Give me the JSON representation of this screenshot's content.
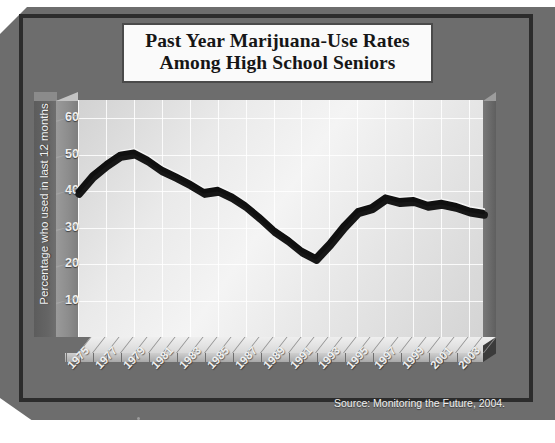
{
  "figure": {
    "title_line1": "Past Year Marijuana-Use Rates",
    "title_line2": "Among High School Seniors",
    "source": "Source: Monitoring the Future, 2004.",
    "colors": {
      "background": "#6d6d6d",
      "plot_face": "#eeeeee",
      "line": "#151515",
      "line_highlight": "#ffffff",
      "frame": "#2c2c2c",
      "axis_slab": "#8d8d8d",
      "label_slab": "#636363",
      "tick_text": "#f0f0f0"
    }
  },
  "chart_data": {
    "type": "line",
    "title": "Past Year Marijuana-Use Rates Among High School Seniors",
    "xlabel": "",
    "ylabel": "Percentage who used in last 12 months",
    "ylim": [
      0,
      65
    ],
    "xlim": [
      1975,
      2004
    ],
    "grid": true,
    "legend": null,
    "ytick_labels": [
      "60",
      "50",
      "40",
      "30",
      "20",
      "10"
    ],
    "ytick_values": [
      60,
      50,
      40,
      30,
      20,
      10
    ],
    "xtick_labels": [
      "1975",
      "1977",
      "1979",
      "1981",
      "1983",
      "1985",
      "1987",
      "1989",
      "1991",
      "1993",
      "1995",
      "1997",
      "1999",
      "2001",
      "2003"
    ],
    "xtick_values": [
      1975,
      1977,
      1979,
      1981,
      1983,
      1985,
      1987,
      1989,
      1991,
      1993,
      1995,
      1997,
      1999,
      2001,
      2003
    ],
    "x": [
      1975,
      1976,
      1977,
      1978,
      1979,
      1980,
      1981,
      1982,
      1983,
      1984,
      1985,
      1986,
      1987,
      1988,
      1989,
      1990,
      1991,
      1992,
      1993,
      1994,
      1995,
      1996,
      1997,
      1998,
      1999,
      2000,
      2001,
      2002,
      2003,
      2004
    ],
    "values": [
      40.0,
      44.5,
      47.6,
      50.2,
      50.8,
      48.8,
      46.1,
      44.3,
      42.3,
      40.0,
      40.6,
      38.8,
      36.3,
      33.1,
      29.6,
      27.0,
      23.9,
      21.9,
      26.0,
      30.7,
      34.7,
      35.8,
      38.5,
      37.5,
      37.8,
      36.5,
      37.0,
      36.2,
      34.9,
      34.3
    ],
    "series": [
      {
        "name": "Past year marijuana use, 12th graders",
        "values": [
          40.0,
          44.5,
          47.6,
          50.2,
          50.8,
          48.8,
          46.1,
          44.3,
          42.3,
          40.0,
          40.6,
          38.8,
          36.3,
          33.1,
          29.6,
          27.0,
          23.9,
          21.9,
          26.0,
          30.7,
          34.7,
          35.8,
          38.5,
          37.5,
          37.8,
          36.5,
          37.0,
          36.2,
          34.9,
          34.3
        ]
      }
    ]
  }
}
